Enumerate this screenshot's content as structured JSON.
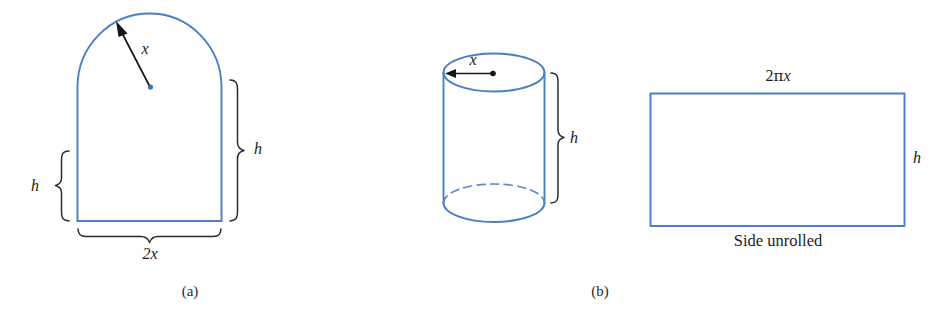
{
  "figure": {
    "kind": "geometry-diagram",
    "background_color": "#ffffff",
    "shape_stroke_color": "#4a7fc4",
    "annotation_color": "#1b1b1b",
    "panels": [
      {
        "id": "a",
        "caption": "(a)",
        "shape_name": "norman-window-arch",
        "labels": {
          "radius": "x",
          "height_right": "h",
          "height_left": "h",
          "width_bottom": "2x"
        }
      },
      {
        "id": "b",
        "caption": "(b)",
        "shape_name": "cylinder-with-unrolled-side",
        "labels": {
          "radius": "x",
          "height": "h",
          "circumference": "2πx",
          "rect_height": "h",
          "rect_caption": "Side unrolled"
        }
      }
    ]
  },
  "panel_a": {
    "radius_label": "x",
    "height_label_right": "h",
    "height_label_left": "h",
    "width_label": "2x",
    "caption": "(a)"
  },
  "panel_b": {
    "radius_label": "x",
    "height_label": "h",
    "caption": "(b)"
  },
  "panel_b_rect": {
    "top_label_num": "2",
    "top_label_greek": "π",
    "top_label_var": "x",
    "top_label_full": "2πx",
    "side_label": "h",
    "bottom_caption": "Side unrolled"
  }
}
